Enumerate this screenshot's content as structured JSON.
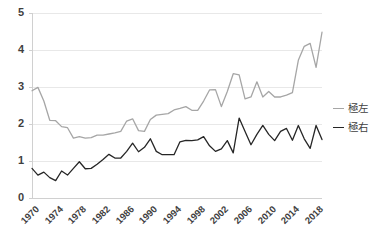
{
  "chart_data": {
    "type": "line",
    "title": "",
    "subtitle": "",
    "xlabel": "",
    "ylabel": "",
    "xlim": [
      1970,
      2019
    ],
    "ylim": [
      0,
      5
    ],
    "grid": true,
    "grid_axis": "y",
    "legend_position": "right",
    "x": [
      1970,
      1971,
      1972,
      1973,
      1974,
      1975,
      1976,
      1977,
      1978,
      1979,
      1980,
      1981,
      1982,
      1983,
      1984,
      1985,
      1986,
      1987,
      1988,
      1989,
      1990,
      1991,
      1992,
      1993,
      1994,
      1995,
      1996,
      1997,
      1998,
      1999,
      2000,
      2001,
      2002,
      2003,
      2004,
      2005,
      2006,
      2007,
      2008,
      2009,
      2010,
      2011,
      2012,
      2013,
      2014,
      2015,
      2016,
      2017,
      2018,
      2019
    ],
    "x_tick_labels": [
      "1970",
      "1974",
      "1978",
      "1982",
      "1986",
      "1990",
      "1994",
      "1998",
      "2002",
      "2006",
      "2010",
      "2014",
      "2018"
    ],
    "y_tick_labels": [
      "0",
      "1",
      "2",
      "3",
      "4",
      "5"
    ],
    "series": [
      {
        "name": "極左",
        "color": "#a6a6a6",
        "values": [
          2.9,
          2.99,
          2.62,
          2.1,
          2.09,
          1.93,
          1.9,
          1.62,
          1.66,
          1.62,
          1.63,
          1.7,
          1.7,
          1.73,
          1.76,
          1.8,
          2.08,
          2.14,
          1.82,
          1.8,
          2.12,
          2.24,
          2.26,
          2.28,
          2.38,
          2.42,
          2.47,
          2.37,
          2.37,
          2.62,
          2.92,
          2.93,
          2.47,
          2.88,
          3.36,
          3.33,
          2.68,
          2.73,
          3.14,
          2.73,
          2.88,
          2.73,
          2.73,
          2.78,
          2.85,
          3.72,
          4.1,
          4.18,
          3.53,
          4.48
        ]
      },
      {
        "name": "極右",
        "color": "#262626",
        "values": [
          0.8,
          0.62,
          0.7,
          0.55,
          0.47,
          0.73,
          0.62,
          0.8,
          0.98,
          0.79,
          0.8,
          0.91,
          1.04,
          1.18,
          1.08,
          1.08,
          1.26,
          1.48,
          1.25,
          1.37,
          1.6,
          1.26,
          1.17,
          1.17,
          1.17,
          1.52,
          1.56,
          1.55,
          1.57,
          1.66,
          1.41,
          1.26,
          1.33,
          1.55,
          1.22,
          2.16,
          1.8,
          1.44,
          1.72,
          1.96,
          1.72,
          1.55,
          1.8,
          1.88,
          1.56,
          1.96,
          1.6,
          1.34,
          1.96,
          1.58
        ]
      }
    ],
    "legend": [
      {
        "label": "極左",
        "color": "#a6a6a6"
      },
      {
        "label": "極右",
        "color": "#262626"
      }
    ]
  },
  "axis_colors": {
    "grid": "#e8e8e8",
    "axis_line": "#d0d0d0",
    "tick_text": "#3f3f3f"
  }
}
